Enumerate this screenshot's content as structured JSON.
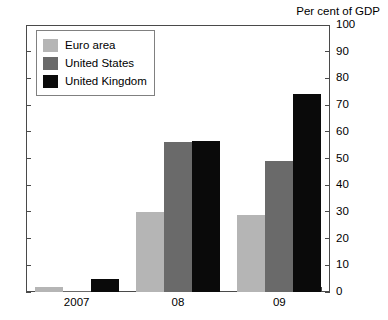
{
  "chart_data": {
    "type": "bar",
    "title": "Per cent of GDP",
    "xlabel": "",
    "ylabel": "Per cent of GDP",
    "ylim": [
      0,
      100
    ],
    "y_ticks": [
      0,
      10,
      20,
      30,
      40,
      50,
      60,
      70,
      80,
      90,
      100
    ],
    "y_tick_labels": [
      "0",
      "10",
      "20",
      "30",
      "40",
      "50",
      "60",
      "70",
      "80",
      "90",
      "100"
    ],
    "y_axis_position": "right",
    "grid": false,
    "legend_position": "top-left",
    "categories": [
      "2007",
      "08",
      "09"
    ],
    "series": [
      {
        "name": "Euro area",
        "color": "#b5b5b5",
        "values": [
          2,
          30,
          29
        ]
      },
      {
        "name": "United States",
        "color": "#6a6a6a",
        "values": [
          0.5,
          56,
          49
        ]
      },
      {
        "name": "United Kingdom",
        "color": "#0a0a0a",
        "values": [
          5,
          56.5,
          74
        ]
      }
    ]
  },
  "axis": {
    "title": "Per cent of GDP"
  },
  "legend": {
    "entries": [
      {
        "label": "Euro area",
        "color": "#b5b5b5"
      },
      {
        "label": "United States",
        "color": "#6a6a6a"
      },
      {
        "label": "United Kingdom",
        "color": "#0a0a0a"
      }
    ]
  }
}
